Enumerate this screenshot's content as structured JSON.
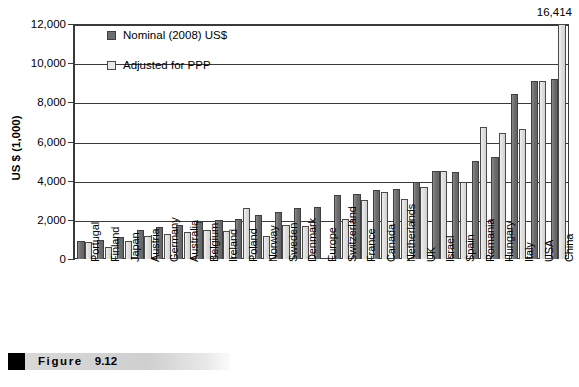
{
  "figure": {
    "label_word": "Figure",
    "number": "9.12"
  },
  "legend": {
    "position": "inside-top-left",
    "entries": [
      {
        "label": "Nominal (2008) US$",
        "swatch": "dark-gray-square-icon",
        "color": "#6e6e6e"
      },
      {
        "label": "Adjusted for PPP",
        "swatch": "light-gray-square-icon",
        "color": "#e8e8e8"
      }
    ]
  },
  "annotation": {
    "china_overflow_value": "16,414"
  },
  "axis": {
    "y_title": "US $ (1,000)",
    "y_ticks": [
      "0",
      "2,000",
      "4,000",
      "6,000",
      "8,000",
      "10,000",
      "12,000"
    ]
  },
  "chart_data": {
    "type": "bar",
    "title": "",
    "subtitle": "",
    "xlabel": "",
    "ylabel": "US $ (1,000)",
    "ylim": [
      0,
      12000
    ],
    "ytick_step": 2000,
    "grid": true,
    "legend_position": "inside-top-left",
    "categories": [
      "Portugal",
      "Finland",
      "Japan",
      "Austria",
      "Germany",
      "Australia",
      "Belgium",
      "Ireland",
      "Poland",
      "Norway",
      "Sweden",
      "Denmark",
      "Europe",
      "Switzerland",
      "France",
      "Canada",
      "Netherlands",
      "UK",
      "Israel",
      "Spain",
      "Romania",
      "Hungary",
      "Italy",
      "USA",
      "China"
    ],
    "series": [
      {
        "name": "Nominal (2008) US$",
        "color": "#6e6e6e",
        "values": [
          900,
          950,
          1100,
          1500,
          1650,
          1750,
          1900,
          2000,
          2050,
          2250,
          2400,
          2600,
          2650,
          3250,
          3300,
          3500,
          3600,
          3950,
          4500,
          4450,
          5000,
          5200,
          8450,
          9100,
          9200
        ]
      },
      {
        "name": "Adjusted for PPP",
        "color": "#e8e8e8",
        "values": [
          850,
          600,
          900,
          1200,
          1300,
          1400,
          1500,
          1450,
          2600,
          1150,
          1750,
          1700,
          null,
          2050,
          3000,
          3400,
          3050,
          3700,
          4500,
          3950,
          6750,
          6450,
          6650,
          9100,
          16414
        ]
      }
    ]
  }
}
